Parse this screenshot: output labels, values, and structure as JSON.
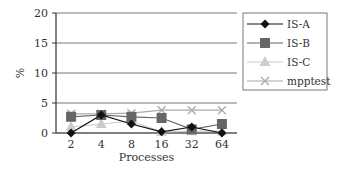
{
  "chart_data": {
    "type": "line",
    "title": "",
    "xlabel": "Processes",
    "ylabel": "%",
    "categories": [
      "2",
      "4",
      "8",
      "16",
      "32",
      "64"
    ],
    "yticks": [
      0,
      5,
      10,
      15,
      20
    ],
    "ylim": [
      0,
      20
    ],
    "grid": true,
    "legend_position": "right",
    "series": [
      {
        "name": "IS-A",
        "marker": "diamond",
        "color": "#111111",
        "values": [
          0,
          3.0,
          1.5,
          0.2,
          1.0,
          0
        ]
      },
      {
        "name": "IS-B",
        "marker": "square",
        "color": "#666666",
        "values": [
          2.7,
          3.0,
          2.7,
          2.5,
          0.6,
          1.5
        ]
      },
      {
        "name": "IS-C",
        "marker": "triangle",
        "color": "#cccccc",
        "values": [
          1.0,
          1.5,
          2.0,
          0.2,
          0.3,
          0.3
        ]
      },
      {
        "name": "mpptest",
        "marker": "x",
        "color": "#aaaaaa",
        "values": [
          3.2,
          3.2,
          3.3,
          3.8,
          3.8,
          3.8
        ]
      }
    ]
  }
}
